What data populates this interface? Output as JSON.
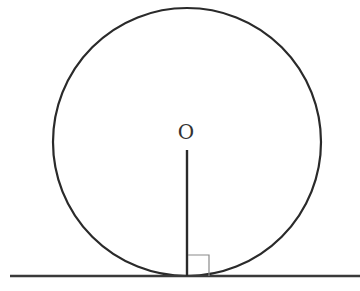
{
  "diagram": {
    "center_label": "O",
    "circle": {
      "cx": 187,
      "cy": 142,
      "r": 134,
      "stroke": "#2a2a2a"
    },
    "radius_segment": {
      "x": 187,
      "y1": 150,
      "y2": 276,
      "stroke": "#2a2a2a"
    },
    "tangent_line": {
      "x1": 10,
      "x2": 360,
      "y": 276,
      "stroke": "#3a3a3a"
    },
    "right_angle_marker": {
      "x": 188,
      "y": 255,
      "size": 21,
      "stroke": "#8a8a8a"
    }
  }
}
